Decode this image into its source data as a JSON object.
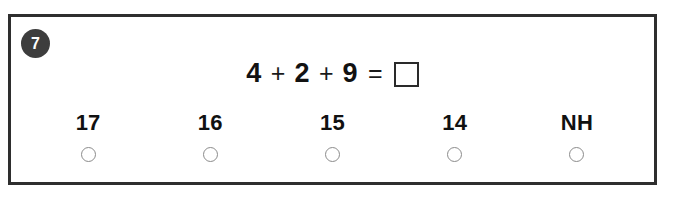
{
  "card": {
    "question_number": "7",
    "border_color": "#2e2e2e",
    "badge_color": "#3d3d3d"
  },
  "equation": {
    "term1": "4",
    "op1": "+",
    "term2": "2",
    "op2": "+",
    "term3": "9",
    "equals": "=",
    "answer_value": ""
  },
  "options": [
    {
      "label": "17",
      "selected": false
    },
    {
      "label": "16",
      "selected": false
    },
    {
      "label": "15",
      "selected": false
    },
    {
      "label": "14",
      "selected": false
    },
    {
      "label": "NH",
      "selected": false
    }
  ]
}
